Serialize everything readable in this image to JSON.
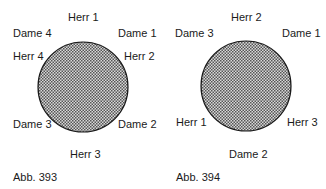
{
  "figures": [
    {
      "caption": "Abb. 393",
      "table_shape": "round",
      "seats": {
        "top": "Herr 1",
        "top_right": "Dame 1",
        "right_upper": "Herr 2",
        "right_lower": "Dame 2",
        "bottom": "Herr 3",
        "left_lower": "Dame 3",
        "left_upper": "Herr 4",
        "top_left": "Dame 4"
      }
    },
    {
      "caption": "Abb. 394",
      "table_shape": "round",
      "seats": {
        "top": "Herr 2",
        "top_right": "Dame 1",
        "right_lower": "Herr 3",
        "bottom": "Dame 2",
        "left_lower": "Herr 1",
        "top_left": "Dame 3"
      }
    }
  ],
  "colors": {
    "table_fill_dark": "#555555",
    "table_fill_light": "#d8d8d8",
    "table_outline": "#1a1a1a",
    "text": "#1a1a1a"
  }
}
